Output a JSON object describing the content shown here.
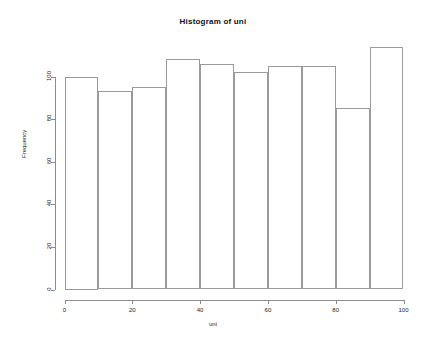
{
  "chart_data": {
    "type": "bar",
    "title": "Histogram of uni",
    "xlabel": "uni",
    "ylabel": "Frequency",
    "grid": false,
    "legend": "none",
    "bin_width": 10,
    "bin_edges": [
      0,
      10,
      20,
      30,
      40,
      50,
      60,
      70,
      80,
      90,
      100
    ],
    "categories": [
      "0-10",
      "10-20",
      "20-30",
      "30-40",
      "40-50",
      "50-60",
      "60-70",
      "70-80",
      "80-90",
      "90-100"
    ],
    "values": [
      100,
      93,
      95,
      108,
      106,
      102,
      105,
      105,
      85,
      114
    ],
    "xlim": [
      0,
      100
    ],
    "ylim": [
      0,
      120
    ],
    "xticks": [
      0,
      20,
      40,
      60,
      80,
      100
    ],
    "xtick_labels": [
      "0",
      "20",
      "40",
      "60",
      "80",
      "100"
    ],
    "yticks": [
      0,
      20,
      40,
      60,
      80,
      100
    ],
    "ytick_labels": [
      "0",
      "20",
      "40",
      "60",
      "80",
      "100"
    ],
    "bar_color": "#ffffff",
    "bar_border_color": "#9a9a9a",
    "axis_color": "#8c8c8c"
  }
}
